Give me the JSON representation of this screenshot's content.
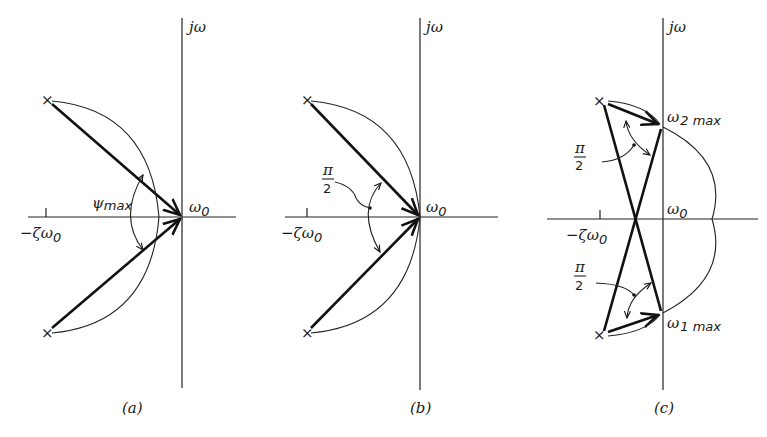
{
  "figure": {
    "panels": [
      {
        "id": "a",
        "caption": "(a)",
        "axis_label_imag": "jω",
        "label_origin": "ω",
        "label_origin_sub": "0",
        "label_real": "−ζω",
        "label_real_sub": "0",
        "angle_label": "ψ",
        "angle_label_sub": "max"
      },
      {
        "id": "b",
        "caption": "(b)",
        "axis_label_imag": "jω",
        "label_origin": "ω",
        "label_origin_sub": "0",
        "label_real": "−ζω",
        "label_real_sub": "0",
        "angle_num": "π",
        "angle_den": "2"
      },
      {
        "id": "c",
        "caption": "(c)",
        "axis_label_imag": "jω",
        "label_origin": "ω",
        "label_origin_sub": "0",
        "label_real": "−ζω",
        "label_real_sub": "0",
        "label_upper": "ω",
        "label_upper_sub": "2 max",
        "label_lower": "ω",
        "label_lower_sub": "1 max",
        "angle_num": "π",
        "angle_den": "2",
        "angle2_num": "π",
        "angle2_den": "2"
      }
    ],
    "pole_marker": "×"
  }
}
